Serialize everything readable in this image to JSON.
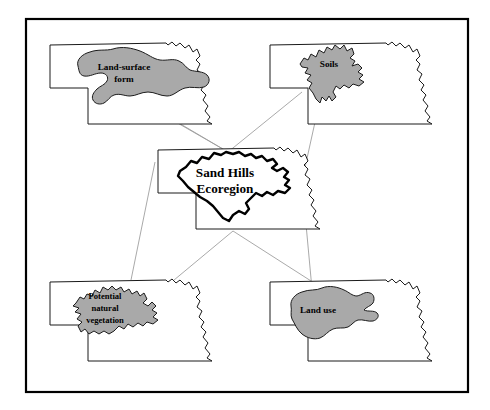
{
  "figure": {
    "frame": {
      "color": "#000000",
      "x": 26,
      "y": 19,
      "width": 442,
      "height": 373
    },
    "palette": {
      "region_fill": "#a9a9a9",
      "region_stroke": "#1c1c1c",
      "state_fill": "#ffffff",
      "state_stroke": "#1a1a1a",
      "connector": "#9a9a9a",
      "text": "#000000",
      "background": "#ffffff"
    }
  },
  "panels": {
    "land_surface_form": {
      "label_lines": [
        "Land-surface",
        "form"
      ],
      "label_full": "Land-surface form",
      "position": "top-left",
      "shaded": true,
      "shape_character": "smooth lobed blob"
    },
    "soils": {
      "label_lines": [
        "Soils"
      ],
      "label_full": "Soils",
      "position": "top-right",
      "shaded": true,
      "shape_character": "irregular jagged"
    },
    "center": {
      "label_lines": [
        "Sand Hills",
        "Ecoregion"
      ],
      "label_full": "Sand Hills Ecoregion",
      "position": "center",
      "shaded": false,
      "shape_character": "thick outlined composite boundary"
    },
    "potential_natural_vegetation": {
      "label_lines": [
        "Potential",
        "natural",
        "vegetation"
      ],
      "label_full": "Potential natural vegetation",
      "position": "bottom-left",
      "shaded": true,
      "shape_character": "crenulated jagged"
    },
    "land_use": {
      "label_lines": [
        "Land use"
      ],
      "label_full": "Land use",
      "position": "bottom-right",
      "shaded": true,
      "shape_character": "rounded with eastern spurs"
    }
  },
  "connectors": [
    {
      "from": "center",
      "to": "land_surface_form",
      "count": 2
    },
    {
      "from": "center",
      "to": "soils",
      "count": 2
    },
    {
      "from": "center",
      "to": "potential_natural_vegetation",
      "count": 2
    },
    {
      "from": "center",
      "to": "land_use",
      "count": 2
    }
  ]
}
